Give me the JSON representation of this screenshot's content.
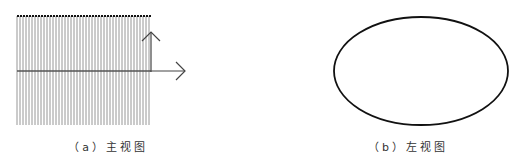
{
  "figure": {
    "panels": [
      {
        "id": "a",
        "caption": "（a）主视图",
        "caption_x": 108,
        "shape": "hatched-rectangle",
        "rect": {
          "x": 17,
          "y": 16,
          "width": 134,
          "height": 109
        },
        "hatch_spacing": 3,
        "arrows": [
          {
            "direction": "up",
            "x1": 151,
            "y1": 72,
            "x2": 151,
            "y2": 32
          },
          {
            "direction": "right",
            "x1": 151,
            "y1": 71,
            "x2": 185,
            "y2": 71
          }
        ],
        "midline_y": 71
      },
      {
        "id": "b",
        "caption": "（b）左视图",
        "caption_x": 408,
        "shape": "ellipse",
        "ellipse": {
          "cx": 421,
          "cy": 71,
          "rx": 87,
          "ry": 54
        }
      }
    ],
    "colors": {
      "stroke": "#111111",
      "hatch": "#8a8a8a",
      "midline": "#555555",
      "background": "#ffffff"
    }
  }
}
